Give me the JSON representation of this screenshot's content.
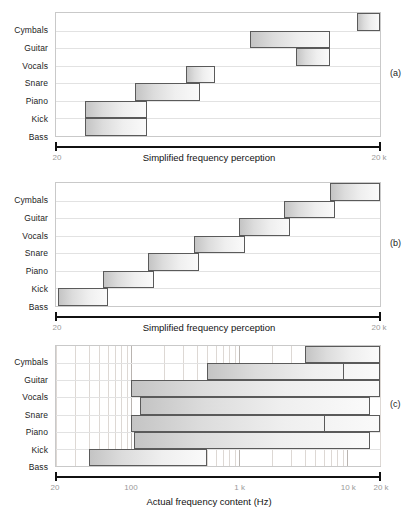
{
  "figure": {
    "categories": [
      "Cymbals",
      "Guitar",
      "Vocals",
      "Snare",
      "Piano",
      "Kick",
      "Bass"
    ],
    "panel_tags": {
      "a": "(a)",
      "b": "(b)",
      "c": "(c)"
    }
  },
  "panel_a": {
    "tag": "(a)",
    "axis_title": "Simplified frequency perception",
    "tick_left": "20",
    "tick_right": "20 k",
    "chart_ref": 0
  },
  "panel_b": {
    "tag": "(b)",
    "axis_title": "Simplified frequency perception",
    "tick_left": "20",
    "tick_right": "20 k",
    "chart_ref": 1
  },
  "panel_c": {
    "tag": "(c)",
    "axis_title": "Actual frequency content (Hz)",
    "ticks": [
      "20",
      "100",
      "1 k",
      "10 k",
      "20 k"
    ],
    "chart_ref": 2
  },
  "chart_data": [
    {
      "type": "bar",
      "orientation": "horizontal",
      "title": "",
      "xlabel": "Simplified frequency perception",
      "ylabel": "",
      "xscale": "log",
      "xlim": [
        20,
        20000
      ],
      "xticks": [
        20,
        20000
      ],
      "xticklabels": [
        "20",
        "20 k"
      ],
      "grid": "horizontal",
      "legend": "none",
      "categories": [
        "Cymbals",
        "Guitar",
        "Vocals",
        "Snare",
        "Piano",
        "Kick",
        "Bass"
      ],
      "bars_fraction": [
        {
          "category": "Cymbals",
          "start": 0.93,
          "end": 1.0,
          "row_top": 0.0,
          "row_bottom": 0.143
        },
        {
          "category": "Guitar",
          "start": 0.6,
          "end": 0.845,
          "row_top": 0.143,
          "row_bottom": 0.286
        },
        {
          "category": "Vocals",
          "start": 0.74,
          "end": 0.845,
          "row_top": 0.286,
          "row_bottom": 0.429
        },
        {
          "category": "Snare",
          "start": 0.4,
          "end": 0.49,
          "row_top": 0.429,
          "row_bottom": 0.571
        },
        {
          "category": "Piano",
          "start": 0.245,
          "end": 0.445,
          "row_top": 0.571,
          "row_bottom": 0.714
        },
        {
          "category": "Kick",
          "start": 0.09,
          "end": 0.28,
          "row_top": 0.714,
          "row_bottom": 0.857
        },
        {
          "category": "Bass",
          "start": 0.09,
          "end": 0.28,
          "row_top": 0.857,
          "row_bottom": 1.0
        }
      ]
    },
    {
      "type": "bar",
      "orientation": "horizontal",
      "title": "",
      "xlabel": "Simplified frequency perception",
      "ylabel": "",
      "xscale": "log",
      "xlim": [
        20,
        20000
      ],
      "xticks": [
        20,
        20000
      ],
      "xticklabels": [
        "20",
        "20 k"
      ],
      "grid": "horizontal",
      "legend": "none",
      "note": "idealised staircase: each instrument occupies a successive band",
      "categories": [
        "Cymbals",
        "Guitar",
        "Vocals",
        "Snare",
        "Piano",
        "Kick",
        "Bass"
      ],
      "bars_fraction": [
        {
          "category": "Cymbals",
          "start": 0.845,
          "end": 1.0,
          "row_top": 0.0,
          "row_bottom": 0.143
        },
        {
          "category": "Guitar",
          "start": 0.705,
          "end": 0.862,
          "row_top": 0.143,
          "row_bottom": 0.286
        },
        {
          "category": "Vocals",
          "start": 0.565,
          "end": 0.722,
          "row_top": 0.286,
          "row_bottom": 0.429
        },
        {
          "category": "Snare",
          "start": 0.425,
          "end": 0.582,
          "row_top": 0.429,
          "row_bottom": 0.571
        },
        {
          "category": "Piano",
          "start": 0.285,
          "end": 0.442,
          "row_top": 0.571,
          "row_bottom": 0.714
        },
        {
          "category": "Kick",
          "start": 0.145,
          "end": 0.302,
          "row_top": 0.714,
          "row_bottom": 0.857
        },
        {
          "category": "Bass",
          "start": 0.005,
          "end": 0.162,
          "row_top": 0.857,
          "row_bottom": 1.0
        }
      ]
    },
    {
      "type": "bar",
      "orientation": "horizontal",
      "title": "",
      "xlabel": "Actual frequency content (Hz)",
      "ylabel": "",
      "xscale": "log",
      "xlim": [
        20,
        20000
      ],
      "xticks": [
        20,
        100,
        1000,
        10000,
        20000
      ],
      "xticklabels": [
        "20",
        "100",
        "1 k",
        "10 k",
        "20 k"
      ],
      "grid": "both",
      "legend": "none",
      "categories": [
        "Cymbals",
        "Guitar",
        "Vocals",
        "Snare",
        "Piano",
        "Kick",
        "Bass"
      ],
      "bars_hz": [
        {
          "category": "Cymbals",
          "start": 4000,
          "end": 20000
        },
        {
          "category": "Guitar",
          "start": 500,
          "end": 20000
        },
        {
          "category": "Vocals",
          "start": 100,
          "end": 20000
        },
        {
          "category": "Snare",
          "start": 120,
          "end": 16000
        },
        {
          "category": "Piano",
          "start": 100,
          "end": 20000
        },
        {
          "category": "Kick",
          "start": 105,
          "end": 16000
        },
        {
          "category": "Bass",
          "start": 40,
          "end": 500
        }
      ],
      "inner_marks_hz": [
        {
          "category": "Guitar",
          "at": 9000
        },
        {
          "category": "Piano",
          "at": 6000
        }
      ]
    }
  ]
}
